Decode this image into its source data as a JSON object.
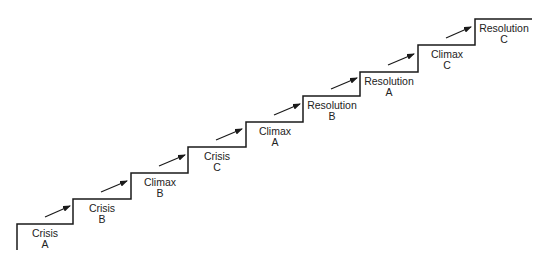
{
  "diagram": {
    "type": "staircase",
    "line_color": "#1a1a1a",
    "steps": [
      {
        "line1": "Crisis",
        "line2": "A",
        "x": 17,
        "x_end": 73,
        "y": 224
      },
      {
        "line1": "Crisis",
        "line2": "B",
        "x": 73,
        "x_end": 131,
        "y": 199
      },
      {
        "line1": "Climax",
        "line2": "B",
        "x": 131,
        "x_end": 188,
        "y": 173
      },
      {
        "line1": "Crisis",
        "line2": "C",
        "x": 188,
        "x_end": 246,
        "y": 147
      },
      {
        "line1": "Climax",
        "line2": "A",
        "x": 246,
        "x_end": 303,
        "y": 122
      },
      {
        "line1": "Resolution",
        "line2": "B",
        "x": 303,
        "x_end": 360,
        "y": 96
      },
      {
        "line1": "Resolution",
        "line2": "A",
        "x": 360,
        "x_end": 418,
        "y": 72
      },
      {
        "line1": "Climax",
        "line2": "C",
        "x": 418,
        "x_end": 475,
        "y": 45
      },
      {
        "line1": "Resolution",
        "line2": "C",
        "x": 475,
        "x_end": 532,
        "y": 19
      }
    ],
    "base_y": 250
  }
}
